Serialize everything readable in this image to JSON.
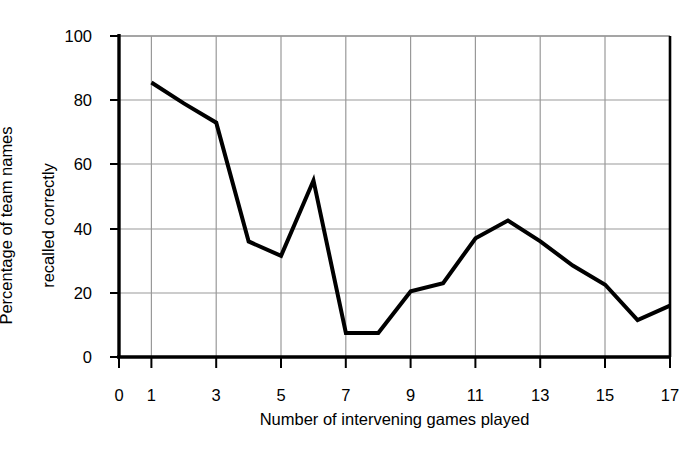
{
  "chart_data": {
    "type": "line",
    "title": "",
    "xlabel": "Number of intervening games played",
    "ylabel": "Percentage of team names\nrecalled correctly",
    "ylabel_line1": "Percentage of team names",
    "ylabel_line2": "recalled correctly",
    "xlim": [
      0,
      17
    ],
    "ylim": [
      0,
      100
    ],
    "xticks": [
      0,
      1,
      3,
      5,
      7,
      9,
      11,
      13,
      15,
      17
    ],
    "xtick_labels": [
      "0",
      "1",
      "3",
      "5",
      "7",
      "9",
      "11",
      "13",
      "15",
      "17"
    ],
    "yticks": [
      0,
      20,
      40,
      60,
      80,
      100
    ],
    "ytick_labels": [
      "0",
      "20",
      "40",
      "60",
      "80",
      "100"
    ],
    "grid": true,
    "grid_x_values": [
      1,
      3,
      5,
      7,
      9,
      11,
      13,
      15,
      17
    ],
    "grid_y_values": [
      20,
      40,
      60,
      80,
      100
    ],
    "grid_color": "#999999",
    "line_color": "#000000",
    "line_width": 4,
    "background": "#ffffff",
    "legend": null,
    "x": [
      1,
      2,
      3,
      4,
      5,
      6,
      7,
      8,
      9,
      10,
      11,
      12,
      13,
      14,
      15,
      16,
      17
    ],
    "values": [
      85.5,
      79,
      73,
      36,
      31.5,
      55,
      7.5,
      7.5,
      20.5,
      23,
      37,
      42.5,
      36,
      28.5,
      22.5,
      11.5,
      16
    ],
    "series": [
      {
        "name": "recall",
        "values": [
          85.5,
          79,
          73,
          36,
          31.5,
          55,
          7.5,
          7.5,
          20.5,
          23,
          37,
          42.5,
          36,
          28.5,
          22.5,
          11.5,
          16
        ]
      }
    ]
  },
  "axes": {
    "x_axis_name": "x-axis",
    "y_axis_name": "y-axis"
  }
}
